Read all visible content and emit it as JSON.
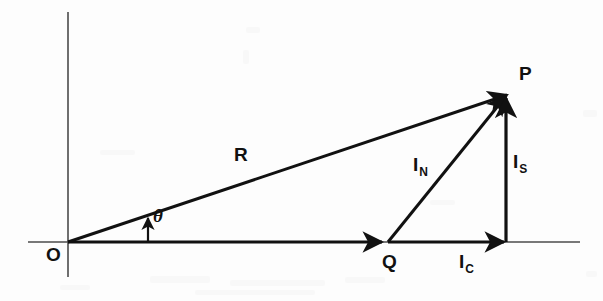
{
  "figure": {
    "type": "phasor-vector-diagram",
    "background_color": "#fdfdfd",
    "ink_color": "#111111",
    "axes": {
      "horizontal": {
        "x1": 28,
        "y1": 242,
        "x2": 580,
        "y2": 242
      },
      "vertical": {
        "x1": 68,
        "y1": 12,
        "x2": 68,
        "y2": 277
      }
    },
    "points": {
      "O": {
        "x": 68,
        "y": 242
      },
      "Q": {
        "x": 388,
        "y": 242
      },
      "P": {
        "x": 508,
        "y": 93
      },
      "F": {
        "x": 506,
        "y": 242
      }
    },
    "vectors": [
      {
        "name": "R",
        "from": "O",
        "to": "P",
        "label": "R"
      },
      {
        "name": "I_C",
        "from": "O",
        "to": "F",
        "label": "I",
        "sub": "C"
      },
      {
        "name": "I_N",
        "from": "Q",
        "to": "P",
        "label": "I",
        "sub": "N"
      },
      {
        "name": "I_S",
        "from": "F",
        "to": "P",
        "label": "I",
        "sub": "S"
      }
    ],
    "angle": {
      "symbol": "θ",
      "between": [
        "I_C",
        "R"
      ],
      "vertex": "O"
    }
  },
  "labels": {
    "origin": "O",
    "point_q": "Q",
    "point_p": "P",
    "resultant": "R",
    "theta": "θ",
    "i_base": "I",
    "sub_c": "C",
    "sub_n": "N",
    "sub_s": "S"
  }
}
